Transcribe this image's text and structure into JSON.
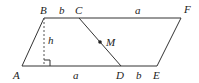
{
  "diagram": {
    "type": "geometry",
    "points": {
      "A": {
        "label": "A",
        "x": 22,
        "y": 66
      },
      "B": {
        "label": "B",
        "x": 44,
        "y": 18
      },
      "C": {
        "label": "C",
        "x": 79,
        "y": 18
      },
      "D": {
        "label": "D",
        "x": 121,
        "y": 66
      },
      "E": {
        "label": "E",
        "x": 157,
        "y": 66
      },
      "F": {
        "label": "F",
        "x": 181,
        "y": 18
      },
      "M": {
        "label": "M",
        "x": 100,
        "y": 42
      },
      "H": {
        "x": 44,
        "y": 66
      }
    },
    "segment_labels": {
      "BC": "b",
      "CF": "a",
      "AD": "a",
      "DE": "b",
      "height": "h"
    },
    "colors": {
      "line": "#333333",
      "dashed": "#555555",
      "text": "#222222"
    }
  }
}
